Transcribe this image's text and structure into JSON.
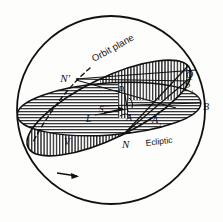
{
  "figure": {
    "background_color": "#fdfdfb",
    "ink_color": "#111111",
    "hatch_color": "#222222"
  },
  "labels": {
    "orbit_plane": "Orbit plane",
    "ecliptic": "Ecliptic",
    "node_ascending": "N",
    "node_descending": "N'",
    "point_Q": "Q",
    "point_P1_base": "P",
    "point_P1_sub": "1",
    "point_P": "P",
    "point_B": "B",
    "point_A": "A",
    "point_A1_base": "A",
    "point_A1_sub": "1",
    "point_S": "S",
    "point_L": "L",
    "point_V": "V"
  },
  "geometry": {
    "sphere": {
      "cx": 111,
      "cy": 110,
      "r": 94
    },
    "ecliptic_ellipse": {
      "cx": 109,
      "cy": 109,
      "rx": 92,
      "ry": 26,
      "rotation": -4
    },
    "orbit_ellipse": {
      "cx": 109,
      "cy": 108,
      "rx": 90,
      "ry": 30,
      "rotation": -26
    }
  },
  "annotations": {
    "direction_arrow": "motion-direction-arrow",
    "radius_arrow": "sun-direction-arrow",
    "hidden_edge": "dashed-hidden-orbit-edge"
  }
}
